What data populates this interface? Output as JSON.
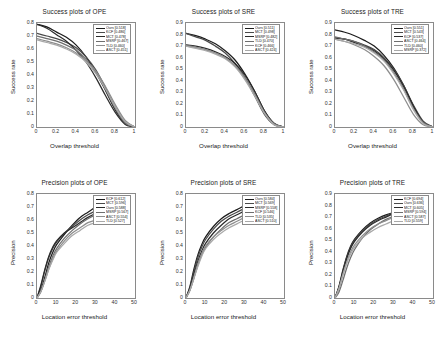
{
  "figure": {
    "background": "#ffffff",
    "rows": 2,
    "cols": 3,
    "style": "grayscale-line-plots"
  },
  "palette": {
    "c1": "#1c1c1c",
    "c2": "#4a4a4a",
    "c3": "#6e6e6e",
    "c4": "#2b2b2b",
    "c5": "#8d8d8d",
    "c6": "#a9a9a9"
  },
  "chart_data": [
    {
      "type": "line",
      "id": "success-ope",
      "title": "Success plots of OPE",
      "xlabel": "Overlap threshold",
      "ylabel": "Success rate",
      "xlim": [
        0,
        1
      ],
      "ylim": [
        0,
        0.8
      ],
      "xticks": [
        "0",
        "0.2",
        "0.4",
        "0.6",
        "0.8",
        "1"
      ],
      "yticks": [
        "0",
        "0.1",
        "0.2",
        "0.3",
        "0.4",
        "0.5",
        "0.6",
        "0.7",
        "0.8"
      ],
      "grid": false,
      "legend_position": "top-right",
      "x": [
        0,
        0.1,
        0.2,
        0.3,
        0.4,
        0.5,
        0.6,
        0.7,
        0.8,
        0.9,
        1
      ],
      "series": [
        {
          "name": "Ours [0.518]",
          "color": "#1c1c1c",
          "values": [
            0.79,
            0.77,
            0.73,
            0.69,
            0.63,
            0.54,
            0.42,
            0.28,
            0.13,
            0.03,
            0.0
          ]
        },
        {
          "name": "KCF [0.486]",
          "color": "#4a4a4a",
          "values": [
            0.72,
            0.7,
            0.68,
            0.65,
            0.61,
            0.54,
            0.44,
            0.3,
            0.15,
            0.04,
            0.0
          ]
        },
        {
          "name": "MCT [0.478]",
          "color": "#2b2b2b",
          "values": [
            0.79,
            0.76,
            0.71,
            0.66,
            0.59,
            0.5,
            0.38,
            0.24,
            0.11,
            0.02,
            0.0
          ]
        },
        {
          "name": "MSRP [0.467]",
          "color": "#6e6e6e",
          "values": [
            0.7,
            0.68,
            0.66,
            0.63,
            0.59,
            0.52,
            0.42,
            0.29,
            0.14,
            0.03,
            0.0
          ]
        },
        {
          "name": "TLD [0.460]",
          "color": "#8d8d8d",
          "values": [
            0.68,
            0.66,
            0.64,
            0.61,
            0.57,
            0.51,
            0.43,
            0.31,
            0.17,
            0.05,
            0.0
          ]
        },
        {
          "name": "ASCT [0.451]",
          "color": "#a9a9a9",
          "values": [
            0.67,
            0.65,
            0.63,
            0.6,
            0.56,
            0.5,
            0.41,
            0.29,
            0.15,
            0.04,
            0.0
          ]
        }
      ]
    },
    {
      "type": "line",
      "id": "success-sre",
      "title": "Success plots of SRE",
      "xlabel": "Overlap threshold",
      "ylabel": "Success rate",
      "xlim": [
        0,
        1
      ],
      "ylim": [
        0,
        0.9
      ],
      "xticks": [
        "0",
        "0.2",
        "0.4",
        "0.6",
        "0.8",
        "1"
      ],
      "yticks": [
        "0",
        "0.1",
        "0.2",
        "0.3",
        "0.4",
        "0.5",
        "0.6",
        "0.7",
        "0.8",
        "0.9"
      ],
      "grid": false,
      "legend_position": "top-right",
      "x": [
        0,
        0.1,
        0.2,
        0.3,
        0.4,
        0.5,
        0.6,
        0.7,
        0.8,
        0.9,
        1
      ],
      "series": [
        {
          "name": "Ours [0.511]",
          "color": "#1c1c1c",
          "values": [
            0.81,
            0.79,
            0.76,
            0.72,
            0.66,
            0.58,
            0.46,
            0.31,
            0.14,
            0.03,
            0.0
          ]
        },
        {
          "name": "MCT [0.498]",
          "color": "#4a4a4a",
          "values": [
            0.81,
            0.78,
            0.75,
            0.7,
            0.64,
            0.55,
            0.43,
            0.27,
            0.11,
            0.02,
            0.0
          ]
        },
        {
          "name": "MSRP [0.482]",
          "color": "#2b2b2b",
          "values": [
            0.71,
            0.7,
            0.68,
            0.65,
            0.61,
            0.55,
            0.45,
            0.31,
            0.14,
            0.03,
            0.0
          ]
        },
        {
          "name": "TLD [0.470]",
          "color": "#6e6e6e",
          "values": [
            0.71,
            0.69,
            0.67,
            0.64,
            0.6,
            0.53,
            0.43,
            0.29,
            0.13,
            0.03,
            0.0
          ]
        },
        {
          "name": "KCF [0.466]",
          "color": "#8d8d8d",
          "values": [
            0.7,
            0.69,
            0.67,
            0.64,
            0.6,
            0.53,
            0.42,
            0.28,
            0.12,
            0.02,
            0.0
          ]
        },
        {
          "name": "ASCT [0.424]",
          "color": "#a9a9a9",
          "values": [
            0.7,
            0.68,
            0.66,
            0.63,
            0.59,
            0.52,
            0.41,
            0.27,
            0.12,
            0.02,
            0.0
          ]
        }
      ]
    },
    {
      "type": "line",
      "id": "success-tre",
      "title": "Success plots of TRE",
      "xlabel": "Overlap threshold",
      "ylabel": "Success rate",
      "xlim": [
        0,
        1
      ],
      "ylim": [
        0,
        0.9
      ],
      "xticks": [
        "0",
        "0.2",
        "0.4",
        "0.6",
        "0.8",
        "1"
      ],
      "yticks": [
        "0",
        "0.1",
        "0.2",
        "0.3",
        "0.4",
        "0.5",
        "0.6",
        "0.7",
        "0.8",
        "0.9"
      ],
      "grid": false,
      "legend_position": "top-right",
      "x": [
        0,
        0.1,
        0.2,
        0.3,
        0.4,
        0.5,
        0.6,
        0.7,
        0.8,
        0.9,
        1
      ],
      "series": [
        {
          "name": "Ours [0.551]",
          "color": "#1c1c1c",
          "values": [
            0.84,
            0.82,
            0.79,
            0.75,
            0.7,
            0.62,
            0.51,
            0.36,
            0.18,
            0.04,
            0.0
          ]
        },
        {
          "name": "MCT [0.543]",
          "color": "#4a4a4a",
          "values": [
            0.77,
            0.76,
            0.74,
            0.71,
            0.67,
            0.6,
            0.5,
            0.36,
            0.19,
            0.05,
            0.0
          ]
        },
        {
          "name": "KCF [0.537]",
          "color": "#2b2b2b",
          "values": [
            0.77,
            0.76,
            0.73,
            0.7,
            0.66,
            0.59,
            0.49,
            0.35,
            0.18,
            0.04,
            0.0
          ]
        },
        {
          "name": "ASCT [0.464]",
          "color": "#6e6e6e",
          "values": [
            0.78,
            0.76,
            0.74,
            0.7,
            0.65,
            0.58,
            0.47,
            0.33,
            0.16,
            0.04,
            0.0
          ]
        },
        {
          "name": "TLD [0.460]",
          "color": "#8d8d8d",
          "values": [
            0.76,
            0.74,
            0.71,
            0.67,
            0.61,
            0.53,
            0.41,
            0.26,
            0.11,
            0.02,
            0.0
          ]
        },
        {
          "name": "MSRP [0.372]",
          "color": "#a9a9a9",
          "values": [
            0.76,
            0.74,
            0.72,
            0.69,
            0.64,
            0.57,
            0.46,
            0.32,
            0.15,
            0.03,
            0.0
          ]
        }
      ]
    },
    {
      "type": "line",
      "id": "precision-ope",
      "title": "Precision plots of OPE",
      "xlabel": "Location error threshold",
      "ylabel": "Precision",
      "xlim": [
        0,
        50
      ],
      "ylim": [
        0,
        0.8
      ],
      "xticks": [
        "0",
        "10",
        "20",
        "30",
        "40",
        "50"
      ],
      "yticks": [
        "0",
        "0.1",
        "0.2",
        "0.3",
        "0.4",
        "0.5",
        "0.6",
        "0.7",
        "0.8"
      ],
      "grid": false,
      "legend_position": "top-right",
      "x": [
        0,
        2,
        4,
        6,
        8,
        10,
        14,
        18,
        22,
        26,
        30,
        34,
        38
      ],
      "series": [
        {
          "name": "KCF [0.612]",
          "color": "#1c1c1c",
          "values": [
            0.0,
            0.06,
            0.16,
            0.27,
            0.35,
            0.41,
            0.49,
            0.56,
            0.62,
            0.66,
            0.7,
            0.73,
            0.745
          ]
        },
        {
          "name": "MCT [0.596]",
          "color": "#4a4a4a",
          "values": [
            0.0,
            0.09,
            0.21,
            0.31,
            0.38,
            0.43,
            0.5,
            0.55,
            0.6,
            0.64,
            0.67,
            0.7,
            0.715
          ]
        },
        {
          "name": "Ours [0.588]",
          "color": "#2b2b2b",
          "values": [
            0.0,
            0.1,
            0.22,
            0.32,
            0.39,
            0.44,
            0.5,
            0.54,
            0.58,
            0.62,
            0.65,
            0.67,
            0.688
          ]
        },
        {
          "name": "MSRP [0.567]",
          "color": "#6e6e6e",
          "values": [
            0.0,
            0.05,
            0.14,
            0.24,
            0.32,
            0.38,
            0.46,
            0.52,
            0.57,
            0.61,
            0.64,
            0.66,
            0.678
          ]
        },
        {
          "name": "ASCT [0.554]",
          "color": "#8d8d8d",
          "values": [
            0.0,
            0.05,
            0.13,
            0.22,
            0.3,
            0.36,
            0.44,
            0.5,
            0.54,
            0.58,
            0.6,
            0.62,
            0.632
          ]
        },
        {
          "name": "TLD [0.527]",
          "color": "#a9a9a9",
          "values": [
            0.0,
            0.05,
            0.13,
            0.22,
            0.29,
            0.35,
            0.42,
            0.48,
            0.52,
            0.56,
            0.58,
            0.6,
            0.612
          ]
        }
      ]
    },
    {
      "type": "line",
      "id": "precision-sre",
      "title": "Precision plots of SRE",
      "xlabel": "Location error threshold",
      "ylabel": "Precision",
      "xlim": [
        0,
        50
      ],
      "ylim": [
        0,
        0.8
      ],
      "xticks": [
        "0",
        "10",
        "20",
        "30",
        "40",
        "50"
      ],
      "yticks": [
        "0",
        "0.1",
        "0.2",
        "0.3",
        "0.4",
        "0.5",
        "0.6",
        "0.7",
        "0.8"
      ],
      "grid": false,
      "legend_position": "top-right",
      "x": [
        0,
        2,
        4,
        6,
        8,
        10,
        14,
        18,
        22,
        26,
        30,
        34,
        38
      ],
      "series": [
        {
          "name": "Ours [0.584]",
          "color": "#1c1c1c",
          "values": [
            0.0,
            0.09,
            0.22,
            0.33,
            0.41,
            0.47,
            0.55,
            0.61,
            0.65,
            0.68,
            0.71,
            0.73,
            0.742
          ]
        },
        {
          "name": "MCT [0.569]",
          "color": "#4a4a4a",
          "values": [
            0.0,
            0.08,
            0.2,
            0.31,
            0.39,
            0.45,
            0.53,
            0.59,
            0.63,
            0.66,
            0.69,
            0.71,
            0.723
          ]
        },
        {
          "name": "MSRP [0.558]",
          "color": "#2b2b2b",
          "values": [
            0.0,
            0.07,
            0.18,
            0.28,
            0.36,
            0.42,
            0.5,
            0.56,
            0.61,
            0.64,
            0.67,
            0.69,
            0.702
          ]
        },
        {
          "name": "KCF [0.546]",
          "color": "#6e6e6e",
          "values": [
            0.0,
            0.06,
            0.15,
            0.25,
            0.33,
            0.39,
            0.47,
            0.53,
            0.58,
            0.61,
            0.64,
            0.66,
            0.672
          ]
        },
        {
          "name": "TLD [0.535]",
          "color": "#8d8d8d",
          "values": [
            0.0,
            0.06,
            0.16,
            0.26,
            0.34,
            0.4,
            0.47,
            0.52,
            0.56,
            0.59,
            0.62,
            0.64,
            0.652
          ]
        },
        {
          "name": "ASCT [0.510]",
          "color": "#a9a9a9",
          "values": [
            0.0,
            0.06,
            0.15,
            0.24,
            0.32,
            0.38,
            0.45,
            0.5,
            0.54,
            0.57,
            0.6,
            0.62,
            0.635
          ]
        }
      ]
    },
    {
      "type": "line",
      "id": "precision-tre",
      "title": "Precision plots of TRE",
      "xlabel": "Location error threshold",
      "ylabel": "Precision",
      "xlim": [
        0,
        50
      ],
      "ylim": [
        0,
        0.9
      ],
      "xticks": [
        "0",
        "10",
        "20",
        "30",
        "40",
        "50"
      ],
      "yticks": [
        "0",
        "0.1",
        "0.2",
        "0.3",
        "0.4",
        "0.5",
        "0.6",
        "0.7",
        "0.8",
        "0.9"
      ],
      "grid": false,
      "legend_position": "top-right",
      "x": [
        0,
        2,
        4,
        6,
        8,
        10,
        14,
        18,
        22,
        26,
        30,
        34,
        38
      ],
      "series": [
        {
          "name": "KCF [0.694]",
          "color": "#1c1c1c",
          "values": [
            0.0,
            0.1,
            0.24,
            0.36,
            0.45,
            0.51,
            0.59,
            0.65,
            0.69,
            0.72,
            0.74,
            0.755,
            0.767
          ]
        },
        {
          "name": "Ours [0.636]",
          "color": "#4a4a4a",
          "values": [
            0.0,
            0.09,
            0.23,
            0.35,
            0.44,
            0.5,
            0.58,
            0.64,
            0.68,
            0.71,
            0.735,
            0.75,
            0.762
          ]
        },
        {
          "name": "MCT [0.605]",
          "color": "#2b2b2b",
          "values": [
            0.0,
            0.09,
            0.22,
            0.34,
            0.43,
            0.49,
            0.57,
            0.63,
            0.67,
            0.7,
            0.73,
            0.745,
            0.757
          ]
        },
        {
          "name": "MSRP [0.594]",
          "color": "#6e6e6e",
          "values": [
            0.0,
            0.05,
            0.15,
            0.26,
            0.35,
            0.42,
            0.52,
            0.59,
            0.64,
            0.68,
            0.71,
            0.735,
            0.752
          ]
        },
        {
          "name": "ASCT [0.587]",
          "color": "#8d8d8d",
          "values": [
            0.0,
            0.08,
            0.2,
            0.31,
            0.4,
            0.46,
            0.54,
            0.6,
            0.64,
            0.67,
            0.7,
            0.72,
            0.735
          ]
        },
        {
          "name": "TLD [0.559]",
          "color": "#a9a9a9",
          "values": [
            0.0,
            0.08,
            0.2,
            0.3,
            0.38,
            0.44,
            0.52,
            0.57,
            0.61,
            0.64,
            0.67,
            0.69,
            0.705
          ]
        }
      ]
    }
  ]
}
